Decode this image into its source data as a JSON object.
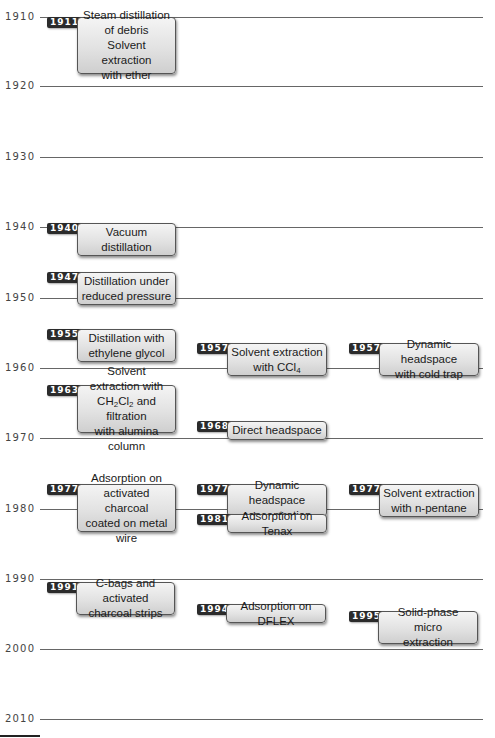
{
  "timeline": {
    "ticks": [
      "1910",
      "1920",
      "1930",
      "1940",
      "1950",
      "1960",
      "1970",
      "1980",
      "1990",
      "2000",
      "2010"
    ],
    "events": [
      {
        "year": "1911",
        "lines": [
          "Steam distillation",
          "of debris",
          "Solvent extraction",
          "with ether"
        ]
      },
      {
        "year": "1940",
        "lines": [
          "Vacuum",
          "distillation"
        ]
      },
      {
        "year": "1947",
        "lines": [
          "Distillation under",
          "reduced pressure"
        ]
      },
      {
        "year": "1955",
        "lines": [
          "Distillation with",
          "ethylene glycol"
        ]
      },
      {
        "year": "1957",
        "lines": [
          "Solvent extraction",
          "with CCl4"
        ]
      },
      {
        "year": "1957",
        "lines": [
          "Dynamic headspace",
          "with cold trap"
        ]
      },
      {
        "year": "1963",
        "lines": [
          "Solvent extraction with",
          "CH2Cl2 and filtration",
          "with alumina column"
        ]
      },
      {
        "year": "1968",
        "lines": [
          "Direct headspace"
        ]
      },
      {
        "year": "1977",
        "lines": [
          "Adsorption on",
          "activated charcoal",
          "coated on metal wire"
        ]
      },
      {
        "year": "1977",
        "lines": [
          "Dynamic headspace",
          "concentration"
        ]
      },
      {
        "year": "1981",
        "lines": [
          "Adsorption on Tenax"
        ]
      },
      {
        "year": "1977",
        "lines": [
          "Solvent extraction",
          "with n-pentane"
        ]
      },
      {
        "year": "1991",
        "lines": [
          "C-bags and activated",
          "charcoal strips"
        ]
      },
      {
        "year": "1994",
        "lines": [
          "Adsorption on DFLEX"
        ]
      },
      {
        "year": "1995",
        "lines": [
          "Solid-phase micro",
          "extraction"
        ]
      }
    ]
  },
  "chemistry": {
    "ccl4": {
      "pre": "with CCl",
      "sub": "4"
    },
    "ch2cl2": {
      "a": "CH",
      "s1": "2",
      "b": "Cl",
      "s2": "2",
      "rest": " and filtration"
    }
  }
}
